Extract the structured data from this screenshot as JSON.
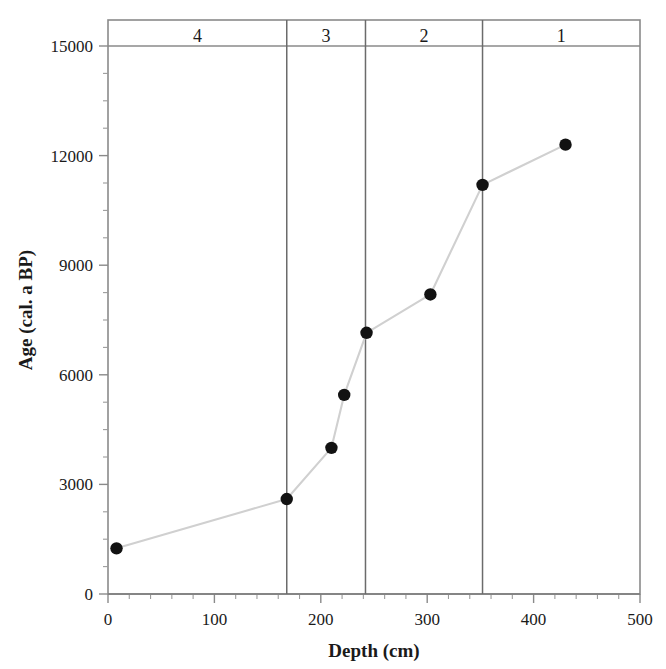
{
  "chart_data": {
    "type": "line",
    "title": "",
    "xlabel": "Depth (cm)",
    "ylabel": "Age (cal. a BP)",
    "xlim": [
      0,
      500
    ],
    "ylim": [
      0,
      15000
    ],
    "grid": false,
    "legend": "none",
    "x_ticks": [
      "0",
      "100",
      "200",
      "300",
      "400",
      "500"
    ],
    "x_tick_values": [
      0,
      100,
      200,
      300,
      400,
      500
    ],
    "x_minor_tick_interval": 20,
    "y_ticks": [
      "0",
      "3000",
      "6000",
      "9000",
      "12000",
      "15000"
    ],
    "y_tick_values": [
      0,
      3000,
      6000,
      9000,
      12000,
      15000
    ],
    "y_minor_tick_interval": 750,
    "series": [
      {
        "name": "age-depth model",
        "marker": "filled-circle",
        "marker_color": "#121212",
        "line_color": "#d0d0d0",
        "x": [
          8,
          168,
          210,
          222,
          243,
          303,
          352,
          430
        ],
        "y": [
          1250,
          2600,
          4000,
          5450,
          7150,
          8200,
          11200,
          12300
        ],
        "points": [
          {
            "depth": 8,
            "age": 1250
          },
          {
            "depth": 168,
            "age": 2600
          },
          {
            "depth": 210,
            "age": 4000
          },
          {
            "depth": 222,
            "age": 5450
          },
          {
            "depth": 243,
            "age": 7150
          },
          {
            "depth": 303,
            "age": 8200
          },
          {
            "depth": 352,
            "age": 11200
          },
          {
            "depth": 430,
            "age": 12300
          }
        ]
      }
    ],
    "zones": [
      {
        "label": "4",
        "start": 0,
        "end": 168
      },
      {
        "label": "3",
        "start": 168,
        "end": 242
      },
      {
        "label": "2",
        "start": 242,
        "end": 352
      },
      {
        "label": "1",
        "start": 352,
        "end": 500
      }
    ],
    "zone_boundaries": [
      168,
      242,
      352
    ],
    "zone_header_baseline_age": 15000,
    "colors": {
      "marker": "#121212",
      "line": "#d0d0d0",
      "axis": "#8a8a8a",
      "divider": "#6b6b6b",
      "text": "#1a1a1a",
      "background": "#ffffff"
    }
  }
}
